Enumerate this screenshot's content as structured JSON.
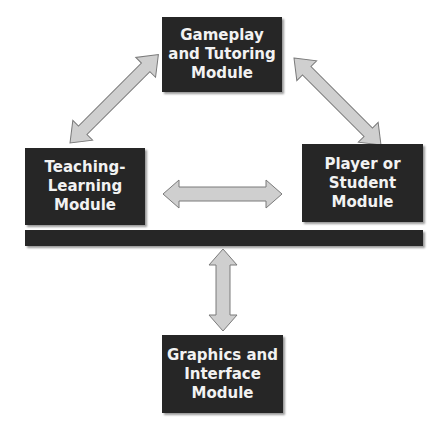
{
  "diagram": {
    "modules": {
      "gameplay": "Gameplay\nand Tutoring\nModule",
      "teaching": "Teaching-\nLearning\nModule",
      "player": "Player or\nStudent\nModule",
      "graphics": "Graphics and\nInterface\nModule"
    },
    "colors": {
      "box_fill": "#262626",
      "box_text": "#f2f2f2",
      "arrow_fill": "#cfcfcf",
      "arrow_stroke": "#7a7a7a"
    },
    "connections": [
      {
        "from": "gameplay",
        "to": "teaching",
        "type": "bidirectional"
      },
      {
        "from": "gameplay",
        "to": "player",
        "type": "bidirectional"
      },
      {
        "from": "teaching",
        "to": "player",
        "type": "bidirectional"
      },
      {
        "from": "bar",
        "to": "graphics",
        "type": "bidirectional"
      }
    ]
  }
}
